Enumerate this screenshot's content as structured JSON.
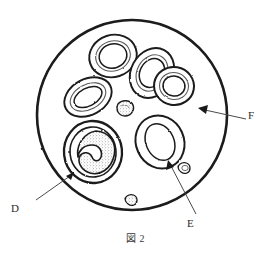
{
  "figure": {
    "caption": "図 2",
    "field": {
      "shape": "circle",
      "center_x": 132,
      "center_y": 115,
      "radius": 95,
      "stroke_color": "#1a1a1a",
      "stroke_width": 2.6,
      "fill_color": "#ffffff"
    },
    "colors": {
      "ink": "#1a1a1a",
      "label_text": "#2b2b2b",
      "caption_text": "#3a3a3a",
      "stipple": "#6e6e6e",
      "background": "#ffffff"
    }
  },
  "labels": [
    {
      "id": "D",
      "text": "D",
      "points_to": "large-granulocyte-cell",
      "arrow_from_x": 36,
      "arrow_from_y": 200,
      "arrow_to_x": 72,
      "arrow_to_y": 174
    },
    {
      "id": "E",
      "text": "E",
      "points_to": "right-erythrocyte-cell",
      "arrow_from_x": 196,
      "arrow_from_y": 214,
      "arrow_to_x": 168,
      "arrow_to_y": 162
    },
    {
      "id": "F",
      "text": "F",
      "points_to": "field-background-plasma",
      "arrow_from_x": 246,
      "arrow_from_y": 119,
      "arrow_to_x": 199,
      "arrow_to_y": 108
    }
  ],
  "cells": [
    {
      "id": "cell-top-left",
      "type": "erythrocyte",
      "cx": 113,
      "cy": 56,
      "rx": 24,
      "ry": 21,
      "rotation": -18,
      "inner_rx": 14,
      "inner_ry": 12,
      "stippled_ring": true
    },
    {
      "id": "cell-top-right-a",
      "type": "erythrocyte",
      "cx": 152,
      "cy": 73,
      "rx": 21,
      "ry": 26,
      "rotation": 28,
      "inner_rx": 12,
      "inner_ry": 15,
      "stippled_ring": true
    },
    {
      "id": "cell-top-right-b",
      "type": "erythrocyte",
      "cx": 174,
      "cy": 86,
      "rx": 20,
      "ry": 19,
      "rotation": 10,
      "inner_rx": 11,
      "inner_ry": 10,
      "stippled_ring": true
    },
    {
      "id": "cell-mid-left",
      "type": "erythrocyte",
      "cx": 88,
      "cy": 97,
      "rx": 25,
      "ry": 18,
      "rotation": -28,
      "inner_rx": 15,
      "inner_ry": 9,
      "stippled_ring": true
    },
    {
      "id": "cell-large-d",
      "type": "granulocyte",
      "cx": 93,
      "cy": 152,
      "rx": 29,
      "ry": 31,
      "rotation": -6,
      "inner_rx": 19,
      "inner_ry": 21,
      "stippled_ring": true
    },
    {
      "id": "cell-right-e",
      "type": "erythrocyte",
      "cx": 160,
      "cy": 142,
      "rx": 24,
      "ry": 27,
      "rotation": -24,
      "inner_rx": 14,
      "inner_ry": 16,
      "stippled_ring": false
    }
  ],
  "platelets": [
    {
      "id": "platelet-center",
      "cx": 125,
      "cy": 108,
      "r": 8
    },
    {
      "id": "platelet-right",
      "cx": 185,
      "cy": 168,
      "r": 6
    },
    {
      "id": "platelet-bottom",
      "cx": 132,
      "cy": 201,
      "r": 6
    }
  ]
}
